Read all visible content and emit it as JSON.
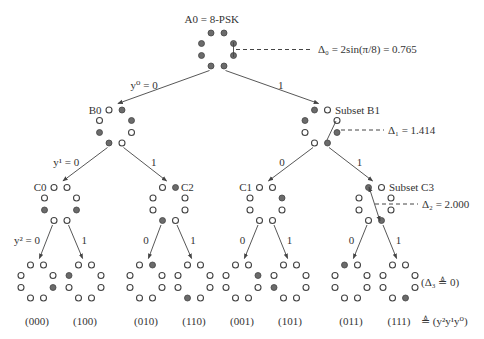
{
  "figure": {
    "title_root": "A0 = 8-PSK",
    "colors": {
      "filled_point": "#6b6b6b",
      "outline": "#444444",
      "text": "#333333"
    },
    "nodes": [
      {
        "id": "A0",
        "label": "A0 = 8-PSK",
        "cx": 217.5,
        "cy": 49.5,
        "filled": [
          1,
          1,
          1,
          1,
          1,
          1,
          1,
          1
        ]
      },
      {
        "id": "B0",
        "label": "B0",
        "cx": 115.5,
        "cy": 126.5,
        "filled": [
          0,
          1,
          0,
          1,
          1,
          0,
          1,
          0
        ]
      },
      {
        "id": "B1",
        "label": "Subset B1",
        "cx": 321,
        "cy": 126.5,
        "filled": [
          1,
          0,
          1,
          0,
          0,
          1,
          0,
          1
        ]
      },
      {
        "id": "C0",
        "label": "C0",
        "cx": 60.5,
        "cy": 204,
        "filled": [
          0,
          0,
          0,
          0,
          1,
          1,
          0,
          0
        ]
      },
      {
        "id": "C2",
        "label": "C2",
        "cx": 169,
        "cy": 204,
        "filled": [
          0,
          1,
          0,
          0,
          0,
          0,
          1,
          0
        ]
      },
      {
        "id": "C1",
        "label": "C1",
        "cx": 266,
        "cy": 204,
        "filled": [
          0,
          0,
          0,
          1,
          0,
          0,
          0,
          0
        ]
      },
      {
        "id": "C3",
        "label": "Subset C3",
        "cx": 375,
        "cy": 204,
        "filled": [
          1,
          0,
          0,
          0,
          0,
          0,
          0,
          1
        ]
      },
      {
        "id": "000",
        "label": "(000)",
        "cx": 37,
        "cy": 281.5,
        "filled": [
          0,
          0,
          0,
          0,
          0,
          1,
          0,
          0
        ]
      },
      {
        "id": "100",
        "label": "(100)",
        "cx": 85,
        "cy": 281.5,
        "filled": [
          0,
          0,
          1,
          0,
          0,
          0,
          0,
          0
        ]
      },
      {
        "id": "010",
        "label": "(010)",
        "cx": 146,
        "cy": 281.5,
        "filled": [
          0,
          1,
          0,
          0,
          0,
          0,
          0,
          0
        ]
      },
      {
        "id": "110",
        "label": "(110)",
        "cx": 194,
        "cy": 281.5,
        "filled": [
          0,
          0,
          0,
          0,
          0,
          0,
          1,
          0
        ]
      },
      {
        "id": "001",
        "label": "(001)",
        "cx": 242,
        "cy": 281.5,
        "filled": [
          0,
          0,
          0,
          1,
          0,
          0,
          0,
          0
        ]
      },
      {
        "id": "101",
        "label": "(101)",
        "cx": 290,
        "cy": 281.5,
        "filled": [
          0,
          0,
          0,
          0,
          1,
          0,
          0,
          0
        ]
      },
      {
        "id": "011",
        "label": "(011)",
        "cx": 351,
        "cy": 281.5,
        "filled": [
          1,
          0,
          0,
          0,
          0,
          0,
          0,
          0
        ]
      },
      {
        "id": "111",
        "label": "(111)",
        "cx": 399,
        "cy": 281.5,
        "filled": [
          0,
          0,
          0,
          0,
          0,
          0,
          0,
          1
        ]
      }
    ],
    "edges": [
      {
        "from": "A0",
        "to": "B0",
        "label": "y⁰ = 0"
      },
      {
        "from": "A0",
        "to": "B1",
        "label": "1"
      },
      {
        "from": "B0",
        "to": "C0",
        "label": "y¹ = 0"
      },
      {
        "from": "B0",
        "to": "C2",
        "label": "1"
      },
      {
        "from": "B1",
        "to": "C1",
        "label": "0"
      },
      {
        "from": "B1",
        "to": "C3",
        "label": "1"
      },
      {
        "from": "C0",
        "to": "000",
        "label": "y² = 0"
      },
      {
        "from": "C0",
        "to": "100",
        "label": "1"
      },
      {
        "from": "C2",
        "to": "010",
        "label": "0"
      },
      {
        "from": "C2",
        "to": "110",
        "label": "1"
      },
      {
        "from": "C1",
        "to": "001",
        "label": "0"
      },
      {
        "from": "C1",
        "to": "101",
        "label": "1"
      },
      {
        "from": "C3",
        "to": "011",
        "label": "0"
      },
      {
        "from": "C3",
        "to": "111",
        "label": "1"
      }
    ],
    "annotations": {
      "delta0": "Δ₀ = 2sin(π/8) = 0.765",
      "delta1": "Δ₁ = 1.414",
      "delta2": "Δ₂ = 2.000",
      "delta3": "(Δ₃ ≜ 0)",
      "bit_order": "≜ (y²y¹y⁰)"
    }
  }
}
